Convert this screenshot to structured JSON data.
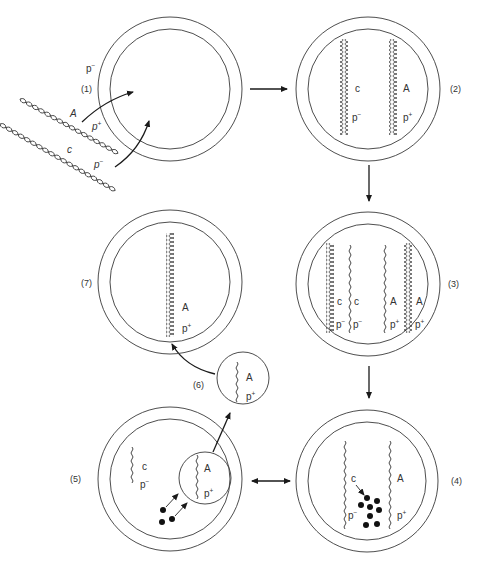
{
  "diagram": {
    "title": "",
    "colors": {
      "line": "#333333",
      "arrow": "#1a1a1a",
      "background": "#ffffff"
    },
    "steps": [
      {
        "id": "1",
        "label": "(1)",
        "cell_genotype": "p⁻",
        "incoming_dna": [
          {
            "gene": "A",
            "marker": "p⁺"
          },
          {
            "gene": "c",
            "marker": "p⁻"
          }
        ]
      },
      {
        "id": "2",
        "label": "(2)",
        "strands": [
          {
            "type": "double",
            "gene": "c",
            "marker": "p⁻"
          },
          {
            "type": "double",
            "gene": "A",
            "marker": "p⁺"
          }
        ]
      },
      {
        "id": "3",
        "label": "(3)",
        "strands": [
          {
            "type": "double",
            "gene": "c",
            "marker": "p⁻"
          },
          {
            "type": "single",
            "gene": "c",
            "marker": "p⁻"
          },
          {
            "type": "single",
            "gene": "A",
            "marker": "p⁺"
          },
          {
            "type": "double",
            "gene": "A",
            "marker": "p⁺"
          }
        ]
      },
      {
        "id": "4",
        "label": "(4)",
        "strands": [
          {
            "type": "single",
            "gene": "c",
            "marker": "p⁻",
            "degraded": true
          },
          {
            "type": "single",
            "gene": "A",
            "marker": "p⁺"
          }
        ]
      },
      {
        "id": "5",
        "label": "(5)",
        "strands": [
          {
            "type": "single",
            "gene": "c",
            "marker": "p⁻"
          },
          {
            "type": "single-in-vesicle",
            "gene": "A",
            "marker": "p⁺"
          }
        ]
      },
      {
        "id": "6",
        "label": "(6)",
        "vesicle": {
          "gene": "A",
          "marker": "p⁺"
        }
      },
      {
        "id": "7",
        "label": "(7)",
        "strands": [
          {
            "type": "double",
            "gene": "A",
            "marker": "p⁺"
          }
        ]
      }
    ],
    "flow": [
      {
        "from": "1",
        "to": "2",
        "type": "single"
      },
      {
        "from": "2",
        "to": "3",
        "type": "single"
      },
      {
        "from": "3",
        "to": "4",
        "type": "single"
      },
      {
        "from": "4",
        "to": "5",
        "type": "double"
      },
      {
        "from": "5",
        "to": "6",
        "type": "single"
      },
      {
        "from": "6",
        "to": "7",
        "type": "single"
      }
    ],
    "text": {
      "s1_label": "(1)",
      "s1_cell": "p",
      "s1_cell_sup": "−",
      "s1_A": "A",
      "s1_Ap": "p",
      "s1_Ap_sup": "+",
      "s1_c": "c",
      "s1_cp": "p",
      "s1_cp_sup": "−",
      "s2_label": "(2)",
      "s2_c": "c",
      "s2_cp": "p",
      "s2_cp_sup": "−",
      "s2_A": "A",
      "s2_Ap": "p",
      "s2_Ap_sup": "+",
      "s3_label": "(3)",
      "s3_c1": "c",
      "s3_c2": "c",
      "s3_p1": "p",
      "s3_p2": "p",
      "s3_minus": "−",
      "s3_A1": "A",
      "s3_A2": "A",
      "s3_p3": "p",
      "s3_p4": "p",
      "s3_plus": "+",
      "s4_label": "(4)",
      "s4_c": "c",
      "s4_cp": "p",
      "s4_cp_sup": "−",
      "s4_A": "A",
      "s4_Ap": "p",
      "s4_Ap_sup": "+",
      "s5_label": "(5)",
      "s5_c": "c",
      "s5_cp": "p",
      "s5_cp_sup": "−",
      "s5_A": "A",
      "s5_Ap": "p",
      "s5_Ap_sup": "+",
      "s6_label": "(6)",
      "s6_A": "A",
      "s6_Ap": "p",
      "s6_Ap_sup": "+",
      "s7_label": "(7)",
      "s7_A": "A",
      "s7_Ap": "p",
      "s7_Ap_sup": "+"
    }
  }
}
